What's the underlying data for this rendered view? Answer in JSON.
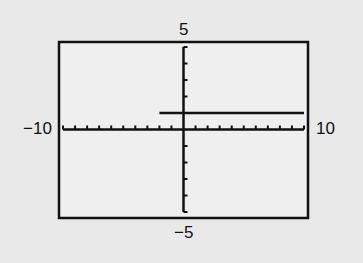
{
  "chart_data": {
    "type": "line",
    "title": "",
    "xlabel": "",
    "ylabel": "",
    "xlim": [
      -10,
      10
    ],
    "ylim": [
      -5,
      5
    ],
    "xscale": 1,
    "yscale": 1,
    "grid": false,
    "tick_labels": {
      "xmin": "−10",
      "xmax": "10",
      "ymax": "5",
      "ymin": "−5"
    },
    "series": [
      {
        "name": "horizontal-line",
        "x": [
          -2,
          10
        ],
        "y": [
          1,
          1
        ],
        "description": "y = 1 for x ≥ -2"
      }
    ]
  },
  "colors": {
    "background": "#e9e9e9",
    "plot_background": "#efefef",
    "ink": "#111111"
  }
}
